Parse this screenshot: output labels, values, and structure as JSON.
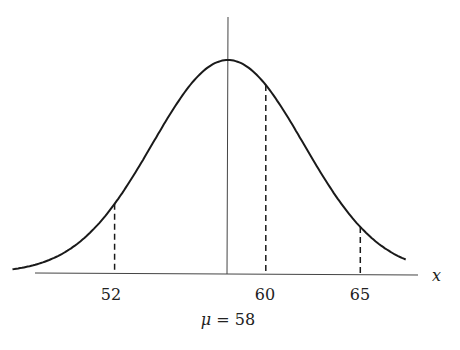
{
  "chart_data": {
    "type": "line",
    "title": "",
    "distribution": {
      "name": "normal",
      "mean": 58,
      "sd": 4
    },
    "xlabel": "x",
    "ylabel": "",
    "xlim": [
      46.6,
      67.4
    ],
    "mean_label": "μ = 58",
    "markers": [
      {
        "x": 52,
        "label": "52",
        "style": "dashed"
      },
      {
        "x": 60,
        "label": "60",
        "style": "dashed"
      },
      {
        "x": 65,
        "label": "65",
        "style": "dashed"
      }
    ],
    "mean_line": {
      "x": 58,
      "style": "solid"
    }
  },
  "labels": {
    "axis_x": "x",
    "tick_52": "52",
    "tick_60": "60",
    "tick_65": "65",
    "mu_symbol": "μ",
    "mu_equals": " = 58"
  },
  "colors": {
    "stroke": "#1a1a1a",
    "axis": "#444444"
  }
}
